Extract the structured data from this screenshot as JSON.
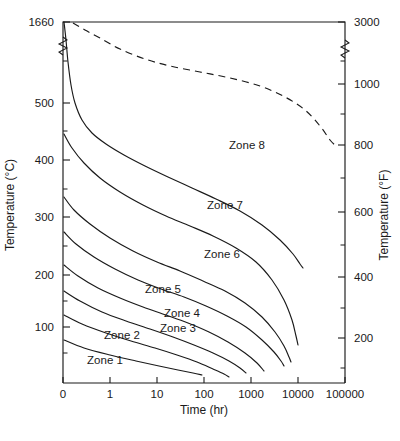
{
  "chart_data": {
    "type": "line",
    "title": "",
    "xlabel": "Time (hr)",
    "ylabel": "Temperature (°C)",
    "ylabel_right": "Temperature (°F)",
    "xscale": "log-with-zero-origin",
    "x_tick_labels": [
      "0",
      "1",
      "10",
      "100",
      "1000",
      "10000",
      "100000"
    ],
    "y_left_tick_labels": [
      "1660",
      "500",
      "400",
      "300",
      "200",
      "100"
    ],
    "y_left_minor_ticks": [
      450,
      350,
      250,
      150,
      50
    ],
    "y_right_tick_labels": [
      "3000",
      "1000",
      "800",
      "600",
      "400",
      "200"
    ],
    "y_right_minor_ticks": [
      900,
      700,
      500,
      300,
      100
    ],
    "axis_break_left": true,
    "axis_break_right": true,
    "grid": false,
    "legend": "inline-zone-labels",
    "zone_labels": [
      {
        "name": "Zone 1",
        "x": 105,
        "y": 364
      },
      {
        "name": "Zone 2",
        "x": 122,
        "y": 339
      },
      {
        "name": "Zone 3",
        "x": 178,
        "y": 332
      },
      {
        "name": "Zone 4",
        "x": 182,
        "y": 317
      },
      {
        "name": "Zone 5",
        "x": 163,
        "y": 293
      },
      {
        "name": "Zone 6",
        "x": 222,
        "y": 258
      },
      {
        "name": "Zone 7",
        "x": 225,
        "y": 209
      },
      {
        "name": "Zone 8",
        "x": 247,
        "y": 149
      }
    ],
    "series": [
      {
        "name": "zone-8-upper-boundary",
        "style": "dashed",
        "points_px": "73,23 85,30 100,38 120,49 145,59 170,66 200,72 230,78 260,86 285,97 305,110 320,126 330,140 336,146"
      },
      {
        "name": "zone-7-zone-8-boundary",
        "style": "solid",
        "points_px": "64,22 66,40 68,62 71,85 75,103 82,120 92,133 106,144 124,155 145,166 168,177 192,188 216,199 240,211 262,225 280,240 293,254 300,264 303,268"
      },
      {
        "name": "zone-6-zone-7-boundary",
        "style": "solid",
        "points_px": "64,134 72,148 84,163 100,178 120,192 143,205 166,216 190,226 213,236 236,248 256,262 272,280 284,300 292,320 296,336 298,345"
      },
      {
        "name": "zone-5-zone-6-boundary",
        "style": "solid",
        "points_px": "64,197 74,210 90,224 110,238 133,251 157,262 180,271 203,281 225,291 245,303 262,317 275,332 284,346 289,357 291,362"
      },
      {
        "name": "zone-4-zone-5-boundary",
        "style": "solid",
        "points_px": "64,232 76,244 94,257 115,269 138,280 161,289 184,297 206,306 227,316 246,327 262,340 274,352 281,361 284,366"
      },
      {
        "name": "zone-3-zone-4-boundary",
        "style": "solid",
        "points_px": "64,265 78,276 98,288 120,298 143,307 166,315 188,323 209,332 228,342 245,353 257,363 264,371"
      },
      {
        "name": "zone-2-zone-3-boundary",
        "style": "solid",
        "points_px": "64,291 80,301 102,312 126,321 150,329 173,337 194,345 213,353 229,361 240,368 246,373"
      },
      {
        "name": "zone-1-zone-2-boundary",
        "style": "solid",
        "points_px": "64,315 82,324 106,333 131,341 155,348 177,355 197,362 213,369 224,374 229,377"
      },
      {
        "name": "zone-1-lower-boundary",
        "style": "solid",
        "points_px": "64,340 84,348 110,355 136,361 159,366 178,370 193,373 202,375"
      }
    ]
  },
  "axes": {
    "left_title": "Temperature (°C)",
    "right_title": "Temperature (°F)",
    "x_title": "Time (hr)",
    "x_ticks": [
      {
        "label": "0",
        "px": 63
      },
      {
        "label": "1",
        "px": 110
      },
      {
        "label": "10",
        "px": 157
      },
      {
        "label": "100",
        "px": 204
      },
      {
        "label": "1000",
        "px": 251
      },
      {
        "label": "10000",
        "px": 298
      },
      {
        "label": "100000",
        "px": 345
      }
    ],
    "y_left_ticks": [
      {
        "label": "1660",
        "px": 22
      },
      {
        "label": "500",
        "px": 103
      },
      {
        "label": "400",
        "px": 160
      },
      {
        "label": "300",
        "px": 217
      },
      {
        "label": "200",
        "px": 275
      },
      {
        "label": "100",
        "px": 327
      }
    ],
    "y_left_minor_px": [
      61,
      131,
      189,
      246,
      301,
      353
    ],
    "y_right_ticks": [
      {
        "label": "3000",
        "px": 22
      },
      {
        "label": "1000",
        "px": 84
      },
      {
        "label": "800",
        "px": 145
      },
      {
        "label": "600",
        "px": 212
      },
      {
        "label": "400",
        "px": 277
      },
      {
        "label": "200",
        "px": 338
      }
    ],
    "y_right_minor_px": [
      61,
      114,
      178,
      245,
      308,
      368
    ],
    "plot_left_px": 63,
    "plot_right_px": 345,
    "plot_top_px": 22,
    "plot_bottom_px": 383
  },
  "colors": {
    "ink": "#1a1a1a",
    "background": "#ffffff"
  }
}
